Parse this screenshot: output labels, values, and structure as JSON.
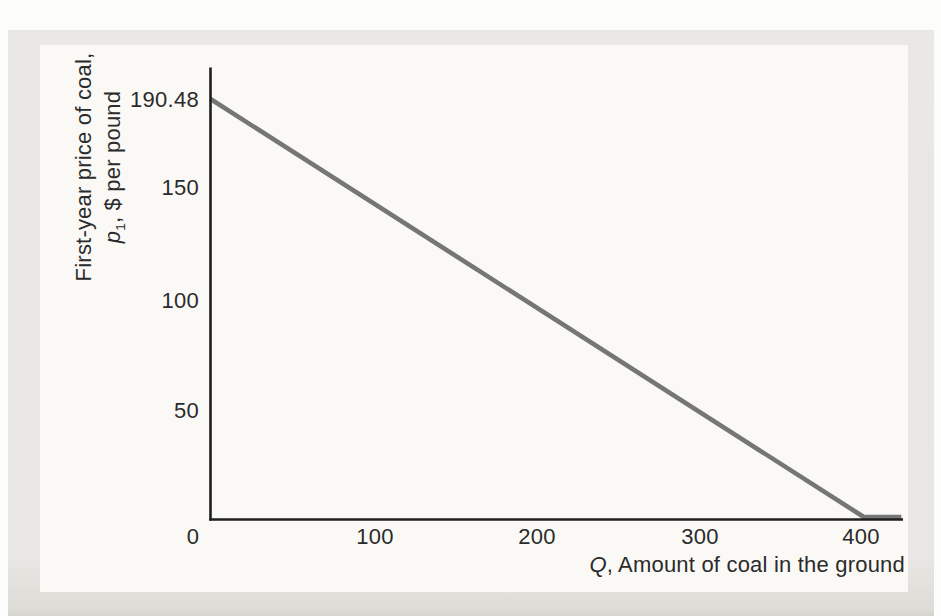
{
  "figure": {
    "background": {
      "page": "#fcfcfb",
      "panel": "#e8e7e3",
      "plot": "#faf9f6"
    },
    "axis_color": "#1f1f1f",
    "line_color": "#767676"
  },
  "chart_data": {
    "type": "line",
    "title": "",
    "xlabel": "Q, Amount of coal in the ground",
    "ylabel": "First-year price of coal, p1, $ per pound",
    "xlabel_parts": {
      "variable": "Q",
      "rest": ", Amount of coal in the ground"
    },
    "ylabel_line1": "First-year price of coal,",
    "ylabel_line2_parts": {
      "variable": "p",
      "subscript": "1",
      "rest": ", $ per pound"
    },
    "x_ticks": [
      0,
      100,
      200,
      300,
      400
    ],
    "x_tick_labels": [
      "0",
      "100",
      "200",
      "300",
      "400"
    ],
    "y_ticks": [
      190.48,
      150,
      100,
      50
    ],
    "y_tick_labels": [
      "190.48",
      "150",
      "100",
      "50"
    ],
    "xlim": [
      0,
      424
    ],
    "ylim": [
      0,
      206
    ],
    "grid": false,
    "legend": "none",
    "series": [
      {
        "name": "first-year-price-of-coal-line",
        "color": "#767676",
        "y_intercept": 190.48,
        "x_intercept": 400,
        "points": [
          [
            0,
            190.48
          ],
          [
            400,
            0
          ],
          [
            423,
            0
          ]
        ]
      }
    ]
  }
}
